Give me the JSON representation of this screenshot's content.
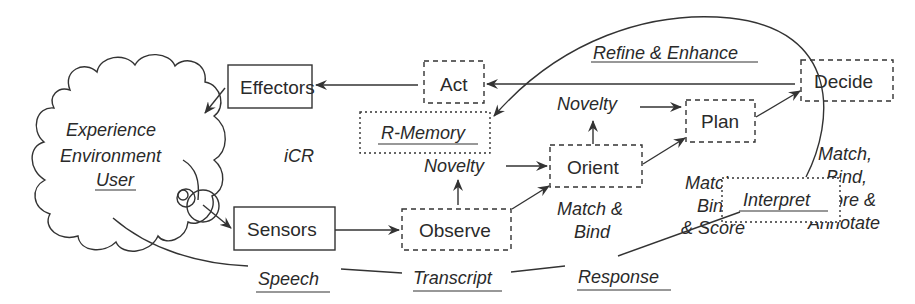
{
  "diagram": {
    "title": "iCR",
    "cloud": {
      "lines": [
        "Experience",
        "Environment",
        "User"
      ],
      "underlined_line": "User"
    },
    "nodes": {
      "effectors": "Effectors",
      "sensors": "Sensors",
      "act": "Act",
      "r_memory": "R-Memory",
      "observe": "Observe",
      "orient": "Orient",
      "plan": "Plan",
      "decide": "Decide",
      "interpret": "Interpret"
    },
    "labels": {
      "refine_enhance": "Refine & Enhance",
      "novelty_upper": "Novelty",
      "novelty_lower": "Novelty",
      "orient_match_1": "Match &",
      "orient_match_2": "Bind",
      "plan_match_1": "Match",
      "plan_match_2": "Bind",
      "plan_match_3": "& Score",
      "decide_match_1": "Match,",
      "decide_match_2": "Bind,",
      "decide_match_3": "Score &",
      "decide_match_4": "Annotate",
      "speech": "Speech",
      "transcript": "Transcript",
      "response": "Response"
    },
    "edges": [
      {
        "from": "Decide",
        "to": "Act"
      },
      {
        "from": "Act",
        "to": "Effectors"
      },
      {
        "from": "Effectors",
        "to": "Experience Environment User"
      },
      {
        "from": "Experience Environment User",
        "to": "Sensors"
      },
      {
        "from": "Sensors",
        "to": "Observe"
      },
      {
        "from": "Observe",
        "to": "Novelty (lower)"
      },
      {
        "from": "Novelty (lower)",
        "to": "Orient"
      },
      {
        "from": "Observe",
        "to": "Orient"
      },
      {
        "from": "Orient",
        "to": "Novelty (upper)"
      },
      {
        "from": "Novelty (upper)",
        "to": "Plan"
      },
      {
        "from": "Orient",
        "to": "Plan"
      },
      {
        "from": "Plan",
        "to": "Decide"
      },
      {
        "from": "Interpret",
        "to": "R-Memory",
        "label": "Refine & Enhance"
      },
      {
        "from": "User",
        "to": "Interpret",
        "via": [
          "Speech",
          "Transcript",
          "Response"
        ]
      }
    ]
  }
}
